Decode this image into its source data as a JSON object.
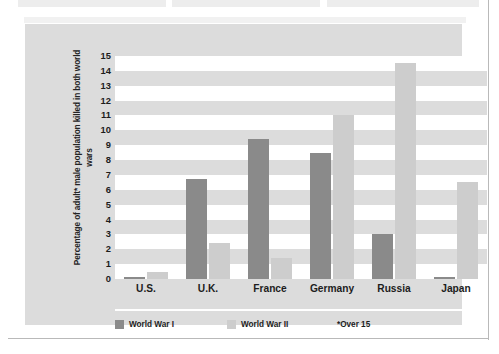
{
  "page": {
    "fragments_above": [
      "box-fragment-left",
      "box-fragment-center",
      "box-fragment-right"
    ]
  },
  "colors": {
    "panel_background": "#dcdcdc",
    "plot_background": "#ffffff",
    "band": "#dcdcdc",
    "ww1_bar": "#8a8a8a",
    "ww2_bar": "#cdcdcd",
    "text": "#1d1d1d"
  },
  "chart_data": {
    "type": "bar",
    "title": "",
    "subtitle": "",
    "xlabel": "",
    "ylabel": "Percentage of adult* male population killed in both world wars",
    "categories": [
      "U.S.",
      "U.K.",
      "France",
      "Germany",
      "Russia",
      "Japan"
    ],
    "series": [
      {
        "name": "World War I",
        "color": "#8a8a8a",
        "values": [
          0.1,
          6.7,
          9.4,
          8.5,
          3.0,
          0.1
        ]
      },
      {
        "name": "World War II",
        "color": "#cdcdcd",
        "values": [
          0.5,
          2.4,
          1.4,
          11.0,
          14.5,
          6.5
        ]
      }
    ],
    "ylim": [
      0,
      15
    ],
    "yticks": [
      0,
      1,
      2,
      3,
      4,
      5,
      6,
      7,
      8,
      9,
      10,
      11,
      12,
      13,
      14,
      15
    ],
    "ytick_labels": [
      "0",
      "1",
      "2",
      "3",
      "4",
      "5",
      "6",
      "7",
      "8",
      "9",
      "10",
      "11",
      "12",
      "13",
      "14",
      "15"
    ],
    "grid": "horizontal-banded",
    "legend_position": "bottom-left",
    "annotations": [
      "*Over 15"
    ]
  },
  "legend": {
    "items": [
      {
        "label": "World War I",
        "swatch": "ww1"
      },
      {
        "label": "World War II",
        "swatch": "ww2"
      }
    ],
    "footnote": "*Over 15"
  }
}
